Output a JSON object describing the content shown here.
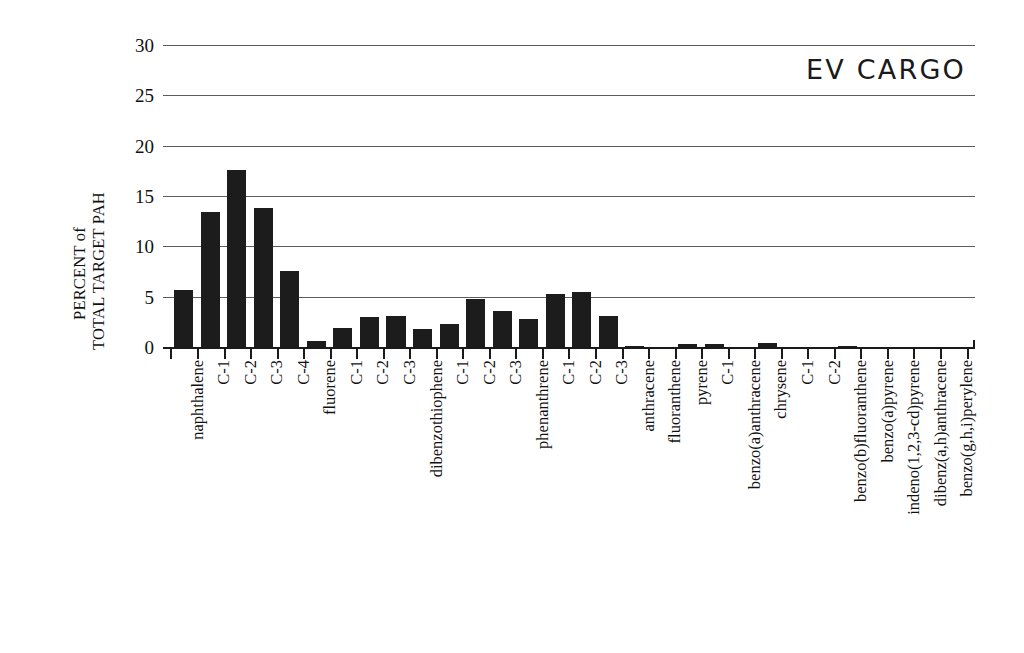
{
  "chart_data": {
    "type": "bar",
    "title": "EV CARGO",
    "xlabel": "",
    "ylabel": "PERCENT of TOTAL TARGET PAH",
    "ylabel_lines": [
      "PERCENT of",
      "TOTAL TARGET PAH"
    ],
    "ylim": [
      0,
      30
    ],
    "yticks": [
      0,
      5,
      10,
      15,
      20,
      25,
      30
    ],
    "ytick_labels": [
      "0",
      "5",
      "10",
      "15",
      "20",
      "25",
      "30"
    ],
    "grid": true,
    "grid_axis": "y",
    "legend": false,
    "bar_color": "#1c1c1c",
    "categories": [
      "naphthalene",
      "C-1",
      "C-2",
      "C-3",
      "C-4",
      "fluorene",
      "C-1",
      "C-2",
      "C-3",
      "dibenzothiophene",
      "C-1",
      "C-2",
      "C-3",
      "phenanthrene",
      "C-1",
      "C-2",
      "C-3",
      "anthracene",
      "fluoranthene",
      "pyrene",
      "C-1",
      "benzo(a)anthracene",
      "chrysene",
      "C-1",
      "C-2",
      "benzo(b)fluoranthene",
      "benzo(a)pyrene",
      "indeno(1,2,3-cd)pyrene",
      "dibenz(a,h)anthracene",
      "benzo(g,h,i)perylene"
    ],
    "values": [
      5.7,
      13.4,
      17.6,
      13.8,
      7.6,
      0.6,
      1.9,
      3.0,
      3.1,
      1.8,
      2.3,
      4.8,
      3.6,
      2.8,
      5.3,
      5.5,
      3.1,
      0.1,
      0.05,
      0.3,
      0.3,
      0.05,
      0.35,
      0.05,
      0.05,
      0.1,
      0.02,
      0.02,
      0.02,
      0.02
    ]
  }
}
